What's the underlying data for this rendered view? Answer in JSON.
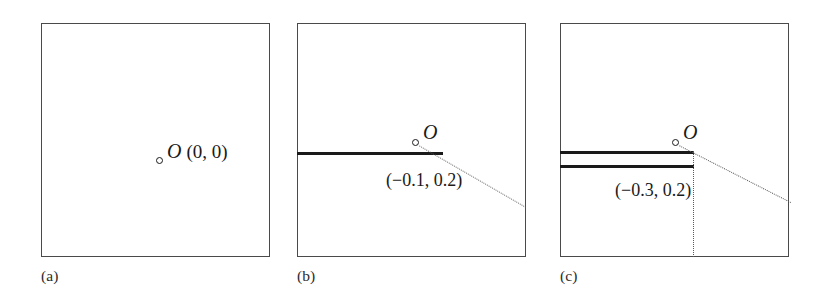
{
  "figure": {
    "type": "technical-diagram",
    "panels": [
      {
        "id": "a",
        "caption": "(a)",
        "origin_marker": {
          "name": "origin-point",
          "x_px": 158,
          "y_px": 138
        },
        "origin_label": "O",
        "origin_coords": "(0, 0)",
        "thick_lines": [],
        "dotted_lines": [],
        "coord_label": ""
      },
      {
        "id": "b",
        "caption": "(b)",
        "origin_marker": {
          "name": "origin-point",
          "x_px": 118,
          "y_px": 119
        },
        "origin_label": "O",
        "coord_label": "(−0.1, 0.2)",
        "thick_lines": [
          {
            "name": "crack-segment-1",
            "x_px": 0,
            "y_px": 131,
            "length_px": 146
          }
        ],
        "dotted_lines": [
          {
            "name": "dotted-diagonal",
            "from_x_px": 120,
            "from_y_px": 121,
            "to_x_px": 229,
            "to_y_px": 184
          }
        ]
      },
      {
        "id": "c",
        "caption": "(c)",
        "origin_marker": {
          "name": "origin-point",
          "x_px": 115,
          "y_px": 119
        },
        "origin_label": "O",
        "coord_label": "(−0.3, 0.2)",
        "thick_lines": [
          {
            "name": "crack-segment-1",
            "x_px": 0,
            "y_px": 129,
            "length_px": 133
          },
          {
            "name": "crack-segment-2",
            "x_px": 0,
            "y_px": 143,
            "length_px": 133
          }
        ],
        "dotted_lines": [
          {
            "name": "dotted-diagonal",
            "from_x_px": 117,
            "from_y_px": 121,
            "to_x_px": 229,
            "to_y_px": 179
          },
          {
            "name": "dotted-vertical",
            "x_px": 133,
            "from_y_px": 129,
            "to_y_px": 234
          }
        ]
      }
    ],
    "colors": {
      "frame": "#4a4a4a",
      "crack": "#1a1a1a",
      "dotted": "#5a5a5a",
      "text": "#1a1a1a",
      "background": "#ffffff"
    }
  }
}
